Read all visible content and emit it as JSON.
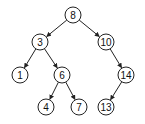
{
  "diagram": {
    "type": "binary-search-tree",
    "node_radius": 8,
    "colors": {
      "stroke": "#222222",
      "fill": "#ffffff",
      "text": "#111111"
    },
    "nodes": [
      {
        "id": "n8",
        "label": "8",
        "x": 73,
        "y": 15
      },
      {
        "id": "n3",
        "label": "3",
        "x": 40,
        "y": 42
      },
      {
        "id": "n10",
        "label": "10",
        "x": 106,
        "y": 42
      },
      {
        "id": "n1",
        "label": "1",
        "x": 20,
        "y": 75
      },
      {
        "id": "n6",
        "label": "6",
        "x": 62,
        "y": 75
      },
      {
        "id": "n14",
        "label": "14",
        "x": 126,
        "y": 75
      },
      {
        "id": "n4",
        "label": "4",
        "x": 46,
        "y": 107
      },
      {
        "id": "n7",
        "label": "7",
        "x": 79,
        "y": 107
      },
      {
        "id": "n13",
        "label": "13",
        "x": 106,
        "y": 107
      }
    ],
    "edges": [
      {
        "from": "n8",
        "to": "n3"
      },
      {
        "from": "n8",
        "to": "n10"
      },
      {
        "from": "n3",
        "to": "n1"
      },
      {
        "from": "n3",
        "to": "n6"
      },
      {
        "from": "n10",
        "to": "n14"
      },
      {
        "from": "n6",
        "to": "n4"
      },
      {
        "from": "n6",
        "to": "n7"
      },
      {
        "from": "n14",
        "to": "n13"
      }
    ]
  }
}
